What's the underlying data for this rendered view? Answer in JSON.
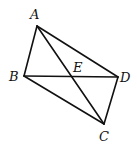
{
  "diagram": {
    "type": "geometry-quadrilateral",
    "stroke_color": "#111111",
    "background": "#ffffff",
    "points": {
      "A": {
        "label": "A",
        "x": 37,
        "y": 26,
        "label_x": 30,
        "label_y": 19
      },
      "B": {
        "label": "B",
        "x": 24,
        "y": 76,
        "label_x": 9,
        "label_y": 81
      },
      "C": {
        "label": "C",
        "x": 104,
        "y": 124,
        "label_x": 99,
        "label_y": 141
      },
      "D": {
        "label": "D",
        "x": 118,
        "y": 77,
        "label_x": 120,
        "label_y": 82
      },
      "E": {
        "label": "E",
        "x": 72,
        "y": 76,
        "label_x": 73,
        "label_y": 72
      }
    },
    "segments": [
      {
        "name": "AB",
        "from": "A",
        "to": "B"
      },
      {
        "name": "AD",
        "from": "A",
        "to": "D"
      },
      {
        "name": "BD",
        "from": "B",
        "to": "D"
      },
      {
        "name": "BC",
        "from": "B",
        "to": "C"
      },
      {
        "name": "CD",
        "from": "C",
        "to": "D"
      },
      {
        "name": "AC",
        "from": "A",
        "to": "C"
      }
    ],
    "intersection": {
      "point": "E",
      "of": [
        "AC",
        "BD"
      ]
    }
  }
}
